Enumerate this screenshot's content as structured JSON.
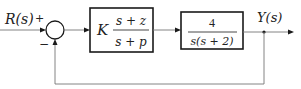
{
  "diagram": {
    "type": "feedback-control-block-diagram",
    "input": {
      "label": "R(s)"
    },
    "output": {
      "label": "Y(s)"
    },
    "summing_junction": {
      "signs": {
        "reference": "+",
        "feedback": "−"
      }
    },
    "blocks": [
      {
        "name": "compensator",
        "gain": "K",
        "numerator": "s + z",
        "denominator": "s + p"
      },
      {
        "name": "plant",
        "numerator": "4",
        "denominator": "s(s + 2)"
      }
    ],
    "feedback": {
      "type": "unity",
      "sign": "negative"
    },
    "colors": {
      "block_stroke": "#1a1a1a",
      "wire": "#777777",
      "background": "#ffffff"
    }
  }
}
